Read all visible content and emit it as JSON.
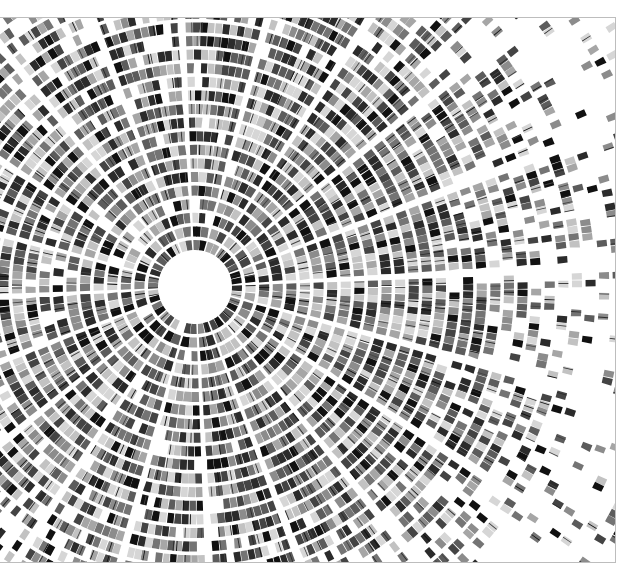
{
  "caption": {
    "text": ""
  },
  "figure": {
    "type": "radial-segment-mosaic",
    "frame": {
      "x": -2,
      "y": 17,
      "width": 618,
      "height": 546,
      "border_color": "#bdbdbd"
    },
    "center": {
      "x": 194,
      "y": 269
    },
    "inner_radius": 33,
    "ring_pitch": 13.6,
    "ring_thickness": 10,
    "ring_count": 42,
    "sector_count": 20,
    "sector_gap_deg": 1.6,
    "dense_radius": 230,
    "palette": [
      "#111111",
      "#2b2b2b",
      "#444444",
      "#5c5c5c",
      "#747474",
      "#8c8c8c",
      "#a6a6a6",
      "#c2c2c2",
      "#d6d6d6"
    ],
    "background": "#ffffff",
    "seed": 7
  }
}
